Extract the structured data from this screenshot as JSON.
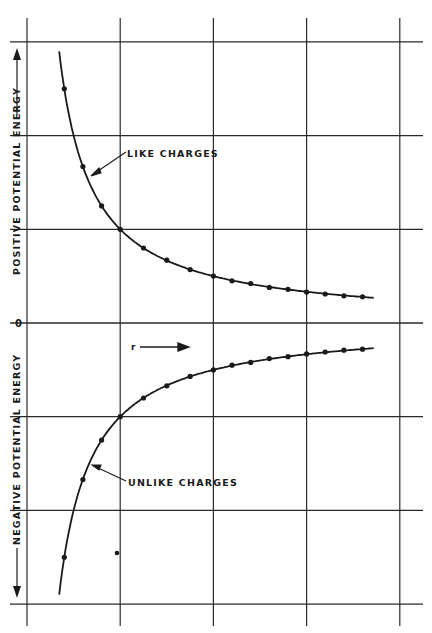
{
  "chart_data": {
    "type": "line",
    "title": "",
    "xlabel": "r",
    "ylabel_positive": "POSITIVE POTENTIAL ENERGY",
    "ylabel_negative": "NEGATIVE POTENTIAL ENERGY",
    "zero_label": "0",
    "grid": true,
    "xlim": [
      0,
      4.2
    ],
    "ylim": [
      -3,
      3
    ],
    "x_gridlines": [
      0,
      1,
      2,
      3,
      4
    ],
    "y_gridlines": [
      -3,
      -2,
      -1,
      0,
      1,
      2,
      3
    ],
    "series": [
      {
        "name": "LIKE CHARGES",
        "sign": "positive",
        "x": [
          0.4,
          0.6,
          0.8,
          1.0,
          1.25,
          1.5,
          1.75,
          2.0,
          2.2,
          2.4,
          2.6,
          2.8,
          3.0,
          3.2,
          3.4,
          3.6
        ],
        "values": [
          2.5,
          1.67,
          1.25,
          1.0,
          0.8,
          0.67,
          0.57,
          0.5,
          0.45,
          0.42,
          0.38,
          0.36,
          0.33,
          0.31,
          0.29,
          0.28
        ]
      },
      {
        "name": "UNLIKE CHARGES",
        "sign": "negative",
        "x": [
          0.4,
          0.6,
          0.8,
          1.0,
          1.25,
          1.5,
          1.75,
          2.0,
          2.2,
          2.4,
          2.6,
          2.8,
          3.0,
          3.2,
          3.4,
          3.6
        ],
        "values": [
          -2.5,
          -1.67,
          -1.25,
          -1.0,
          -0.8,
          -0.67,
          -0.57,
          -0.5,
          -0.45,
          -0.42,
          -0.38,
          -0.36,
          -0.33,
          -0.31,
          -0.29,
          -0.28
        ]
      }
    ],
    "annotations": [
      {
        "text": "LIKE CHARGES",
        "points_to": "upper curve"
      },
      {
        "text": "UNLIKE CHARGES",
        "points_to": "lower curve"
      },
      {
        "text": "r",
        "arrow": "right"
      }
    ]
  },
  "labels": {
    "like": "LIKE CHARGES",
    "unlike": "UNLIKE CHARGES",
    "r": "r",
    "zero": "0",
    "pos_axis": "POSITIVE POTENTIAL ENERGY",
    "neg_axis": "NEGATIVE POTENTIAL ENERGY"
  },
  "colors": {
    "ink": "#1a1a1a",
    "grid": "#2a2a2a",
    "background": "#ffffff"
  }
}
